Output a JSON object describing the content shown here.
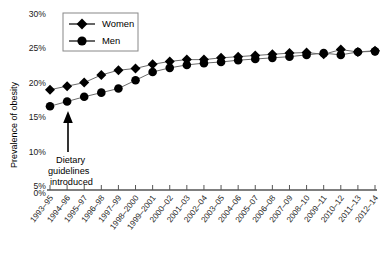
{
  "chart_data": {
    "type": "line",
    "title": "",
    "xlabel": "",
    "ylabel": "Prevalence of obesity",
    "ylim": [
      0,
      30
    ],
    "yticks": [
      0,
      5,
      10,
      15,
      20,
      25,
      30
    ],
    "ytick_labels": [
      "0%",
      "5%",
      "10%",
      "15%",
      "20%",
      "25%",
      "30%"
    ],
    "grid": false,
    "legend_position": "top-left",
    "categories": [
      "1993–95",
      "1994–96",
      "1995–97",
      "1996–98",
      "1997–99",
      "1998–2000",
      "1999–2001",
      "2000–02",
      "2001–03",
      "2002–04",
      "2003–05",
      "2004–06",
      "2005–07",
      "2006–08",
      "2007–09",
      "2008–10",
      "2009–11",
      "2010–12",
      "2011–13",
      "2012–14"
    ],
    "series": [
      {
        "name": "Women",
        "marker": "diamond",
        "values": [
          17.0,
          17.6,
          18.2,
          19.5,
          20.3,
          20.6,
          21.3,
          21.8,
          22.1,
          22.1,
          22.4,
          22.6,
          22.8,
          23.0,
          23.2,
          23.3,
          23.0,
          23.8,
          23.4,
          23.6
        ]
      },
      {
        "name": "Men",
        "marker": "circle",
        "values": [
          14.2,
          15.0,
          15.8,
          16.5,
          17.2,
          18.6,
          20.0,
          20.7,
          21.2,
          21.5,
          21.7,
          22.0,
          22.2,
          22.4,
          22.6,
          22.9,
          23.2,
          22.9,
          23.4,
          23.5
        ]
      }
    ],
    "annotations": [
      {
        "name": "dietary-guidelines",
        "text_lines": [
          "Dietary",
          "guidelines",
          "introduced"
        ],
        "arrow": "up",
        "at_category": "1994–96"
      }
    ]
  },
  "legend": {
    "entries": [
      {
        "label": "Women",
        "marker": "diamond"
      },
      {
        "label": "Men",
        "marker": "circle"
      }
    ]
  },
  "colors": {
    "marker": "#000000",
    "line": "#6b6b6b",
    "axis": "#555555",
    "text": "#000000"
  }
}
